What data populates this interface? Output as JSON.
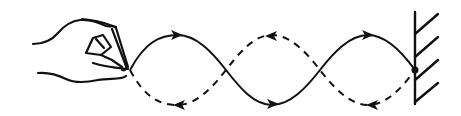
{
  "diagram": {
    "title": "Standing wave on a string between a hand and a fixed wall",
    "elements": {
      "hand": "hand holding string end (driven end)",
      "wave_solid": "solid wave: crest, trough, crest",
      "wave_dashed": "dashed wave: trough, crest, trough",
      "arrows_solid": [
        "right",
        "right",
        "right"
      ],
      "arrows_dashed": [
        "left",
        "left",
        "left"
      ],
      "wall": "fixed wall with hatching",
      "fixed_point": "dot where string attaches to wall"
    },
    "geometry": {
      "nodes_x": [
        130,
        226,
        320,
        415
      ],
      "center_y": 70,
      "crest_y": 35,
      "trough_y": 106
    },
    "colors": {
      "stroke": "#111111",
      "background": "#ffffff"
    }
  }
}
